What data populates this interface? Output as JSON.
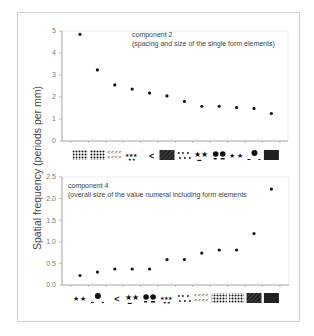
{
  "y_axis_label": "Spatial frequency  (periods per mm)",
  "chart_data": [
    {
      "type": "scatter",
      "title": "component 2",
      "subtitle": "(spacing and size of the single form elements)",
      "ylabel": "Spatial frequency  (periods per mm)",
      "xlabel": "",
      "ylim": [
        0,
        5
      ],
      "yticks": [
        "0",
        "1",
        "2",
        "3",
        "4",
        "5"
      ],
      "categories": [
        "dense dots",
        "dense dots 2",
        "scattered <",
        "small stars",
        "sparse <",
        "hatched",
        "dots",
        "stars",
        "circles",
        "small stars 2",
        "large circle",
        "hatched dark"
      ],
      "values": [
        4.85,
        3.23,
        2.55,
        2.36,
        2.18,
        2.05,
        1.8,
        1.58,
        1.58,
        1.52,
        1.48,
        1.25
      ],
      "grid": false,
      "legend": "none"
    },
    {
      "type": "scatter",
      "title": "component 4",
      "subtitle": "(overall size of the value numeral including form elements",
      "ylabel": "Spatial frequency  (periods per mm)",
      "xlabel": "",
      "ylim": [
        0,
        2.5
      ],
      "yticks": [
        "0.0",
        "0.5",
        "1.0",
        "1.5",
        "2.0",
        "2.5"
      ],
      "categories": [
        "small stars 2",
        "large circle",
        "sparse <",
        "stars",
        "circles",
        "small stars",
        "dots",
        "scattered <",
        "dense dots 2",
        "dense dots",
        "hatched",
        "hatched dark"
      ],
      "values": [
        0.22,
        0.3,
        0.37,
        0.37,
        0.37,
        0.59,
        0.59,
        0.74,
        0.81,
        0.81,
        1.19,
        2.22
      ],
      "grid": false,
      "legend": "none"
    }
  ],
  "top_chart": {
    "title": "component 2",
    "subtitle": "(spacing and size of the single form elements)"
  },
  "bottom_chart": {
    "title": "component 4",
    "subtitle": "(overall size of the value numeral including form elements"
  }
}
